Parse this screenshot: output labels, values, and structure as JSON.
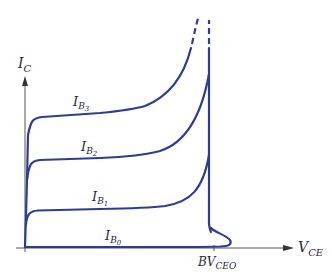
{
  "diagram": {
    "colors": {
      "curve": "#2e3d8f",
      "axis": "#555555",
      "text": "#2a2a3a"
    },
    "axes": {
      "y": {
        "label": "I",
        "sub": "C"
      },
      "x": {
        "label": "V",
        "sub": "CE"
      }
    },
    "breakdown": {
      "label": "BV",
      "sub": "CEO"
    },
    "curves": [
      {
        "id": "IB3",
        "label": "I",
        "sub": "B",
        "subsub": "3"
      },
      {
        "id": "IB2",
        "label": "I",
        "sub": "B",
        "subsub": "2"
      },
      {
        "id": "IB1",
        "label": "I",
        "sub": "B",
        "subsub": "1"
      },
      {
        "id": "IB0",
        "label": "I",
        "sub": "B",
        "subsub": "0"
      }
    ]
  }
}
